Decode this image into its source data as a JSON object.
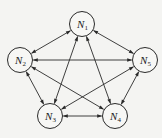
{
  "diagram": {
    "type": "complete-directed-graph",
    "nodes": [
      {
        "id": "N1",
        "label": "N",
        "sub": "1",
        "x": 82,
        "y": 24
      },
      {
        "id": "N2",
        "label": "N",
        "sub": "2",
        "x": 20,
        "y": 60
      },
      {
        "id": "N3",
        "label": "N",
        "sub": "3",
        "x": 50,
        "y": 116
      },
      {
        "id": "N4",
        "label": "N",
        "sub": "4",
        "x": 115,
        "y": 116
      },
      {
        "id": "N5",
        "label": "N",
        "sub": "5",
        "x": 145,
        "y": 60
      }
    ],
    "node_radius": 12.5,
    "edges": [
      {
        "from": "N1",
        "to": "N2",
        "bidirectional": true
      },
      {
        "from": "N1",
        "to": "N5",
        "bidirectional": true
      },
      {
        "from": "N1",
        "to": "N3",
        "bidirectional": true
      },
      {
        "from": "N1",
        "to": "N4",
        "bidirectional": true
      },
      {
        "from": "N2",
        "to": "N5",
        "bidirectional": true
      },
      {
        "from": "N2",
        "to": "N3",
        "bidirectional": true
      },
      {
        "from": "N2",
        "to": "N4",
        "bidirectional": true
      },
      {
        "from": "N5",
        "to": "N3",
        "bidirectional": true
      },
      {
        "from": "N5",
        "to": "N4",
        "bidirectional": true
      },
      {
        "from": "N3",
        "to": "N4",
        "bidirectional": true
      }
    ],
    "colors": {
      "stroke": "#2a2a2a",
      "node_fill": "#f7f7f5",
      "background": "#f4f4f2"
    }
  }
}
